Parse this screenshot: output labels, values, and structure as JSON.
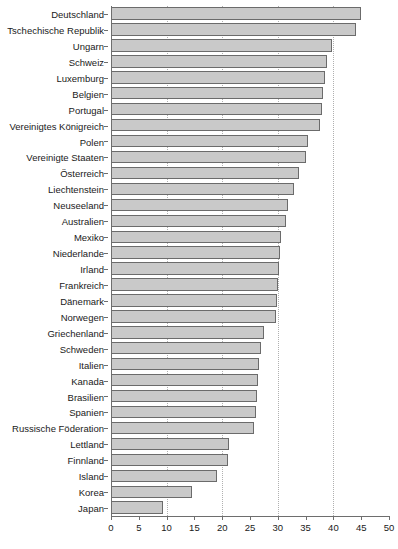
{
  "chart_data": {
    "type": "bar",
    "orientation": "horizontal",
    "title": "",
    "xlabel": "",
    "ylabel": "",
    "xlim": [
      0,
      50
    ],
    "ylim": null,
    "grid": true,
    "gridlines_x": [
      10,
      20,
      30,
      40
    ],
    "legend": null,
    "xticks": [
      0,
      5,
      10,
      15,
      20,
      25,
      30,
      35,
      40,
      45,
      50
    ],
    "xtick_labels": [
      "0",
      "5",
      "10",
      "15",
      "20",
      "25",
      "30",
      "35",
      "40",
      "45",
      "50"
    ],
    "bar_color": "#c9c9c9",
    "bar_edge_color": "#6b6b6b",
    "categories": [
      "Deutschland",
      "Tschechische Republik",
      "Ungarn",
      "Schweiz",
      "Luxemburg",
      "Belgien",
      "Portugal",
      "Vereinigtes Königreich",
      "Polen",
      "Vereinigte Staaten",
      "Österreich",
      "Liechtenstein",
      "Neuseeland",
      "Australien",
      "Mexiko",
      "Niederlande",
      "Irland",
      "Frankreich",
      "Dänemark",
      "Norwegen",
      "Griechenland",
      "Schweden",
      "Italien",
      "Kanada",
      "Brasilien",
      "Spanien",
      "Russische Föderation",
      "Lettland",
      "Finnland",
      "Island",
      "Korea",
      "Japan"
    ],
    "values": [
      45.0,
      44.0,
      39.8,
      38.8,
      38.4,
      38.2,
      38.0,
      37.6,
      35.4,
      35.0,
      33.8,
      33.0,
      31.8,
      31.4,
      30.6,
      30.4,
      30.2,
      30.0,
      29.8,
      29.6,
      27.6,
      27.0,
      26.6,
      26.4,
      26.2,
      26.0,
      25.8,
      21.2,
      21.0,
      19.0,
      14.6,
      9.4
    ]
  }
}
